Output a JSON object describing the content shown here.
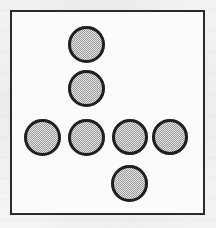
{
  "figure": {
    "name": "circle-arrangement",
    "canvas": {
      "width": 216,
      "height": 228
    },
    "background_color": "#fafaf8",
    "frame": {
      "name": "figure-border",
      "x": 10,
      "y": 10,
      "width": 195,
      "height": 205,
      "stroke_color": "#2b2b2b",
      "stroke_width": 2,
      "fill_color": "#fbfbfa"
    },
    "shape_style": {
      "shape": "circle",
      "outline_color": "#1f1f1f",
      "outline_width": 3,
      "fill_color": "#b9b9b9",
      "fill_pattern": "halftone-gray"
    },
    "circle_count": 7,
    "arrangement": "cross",
    "circles": [
      {
        "id": "circle-1",
        "label": "top",
        "cx": 86,
        "cy": 44,
        "d": 37
      },
      {
        "id": "circle-2",
        "label": "upper-middle",
        "cx": 86,
        "cy": 88,
        "d": 37
      },
      {
        "id": "circle-3",
        "label": "row-left",
        "cx": 42,
        "cy": 137,
        "d": 37
      },
      {
        "id": "circle-4",
        "label": "row-center",
        "cx": 86,
        "cy": 137,
        "d": 37
      },
      {
        "id": "circle-5",
        "label": "row-right",
        "cx": 130,
        "cy": 137,
        "d": 36
      },
      {
        "id": "circle-6",
        "label": "row-far-right",
        "cx": 170,
        "cy": 137,
        "d": 36
      },
      {
        "id": "circle-7",
        "label": "bottom",
        "cx": 129,
        "cy": 183,
        "d": 37
      }
    ]
  }
}
